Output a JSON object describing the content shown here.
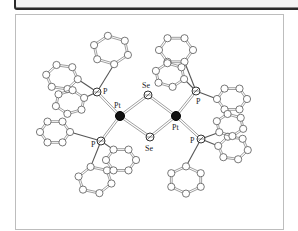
{
  "figure": {
    "type": "crystal-structure",
    "labels": {
      "pt": "Pt",
      "p": "P",
      "se": "Se"
    },
    "core_atoms": [
      {
        "id": "Pt1",
        "element": "Pt",
        "x": 120,
        "y": 116,
        "label": "Pt",
        "lx": 114,
        "ly": 108
      },
      {
        "id": "Pt2",
        "element": "Pt",
        "x": 176,
        "y": 116,
        "label": "Pt",
        "lx": 172,
        "ly": 130
      },
      {
        "id": "Se1",
        "element": "Se",
        "x": 148,
        "y": 95,
        "label": "Se",
        "lx": 142,
        "ly": 88
      },
      {
        "id": "Se2",
        "element": "Se",
        "x": 150,
        "y": 137,
        "label": "Se",
        "lx": 145,
        "ly": 151
      },
      {
        "id": "P1",
        "element": "P",
        "x": 97,
        "y": 92,
        "label": "P",
        "lx": 103,
        "ly": 94
      },
      {
        "id": "P2",
        "element": "P",
        "x": 101,
        "y": 141,
        "label": "P",
        "lx": 91,
        "ly": 147
      },
      {
        "id": "P3",
        "element": "P",
        "x": 196,
        "y": 91,
        "label": "P",
        "lx": 196,
        "ly": 104
      },
      {
        "id": "P4",
        "element": "P",
        "x": 201,
        "y": 139,
        "label": "P",
        "lx": 190,
        "ly": 143
      }
    ],
    "core_bonds": [
      [
        "Pt1",
        "Se1"
      ],
      [
        "Pt1",
        "Se2"
      ],
      [
        "Pt2",
        "Se1"
      ],
      [
        "Pt2",
        "Se2"
      ],
      [
        "Pt1",
        "P1"
      ],
      [
        "Pt1",
        "P2"
      ],
      [
        "Pt2",
        "P3"
      ],
      [
        "Pt2",
        "P4"
      ]
    ],
    "rings": [
      {
        "attach": "P1",
        "cx": 111,
        "cy": 50,
        "r": 18,
        "rot": 80
      },
      {
        "attach": "P1",
        "cx": 62,
        "cy": 77,
        "r": 16,
        "rot": 10
      },
      {
        "attach": "P1",
        "cx": 70,
        "cy": 102,
        "r": 15,
        "rot": 40
      },
      {
        "attach": "P2",
        "cx": 55,
        "cy": 132,
        "r": 15,
        "rot": 0
      },
      {
        "attach": "P2",
        "cx": 95,
        "cy": 180,
        "r": 17,
        "rot": 75
      },
      {
        "attach": "P2",
        "cx": 121,
        "cy": 160,
        "r": 15,
        "rot": 60
      },
      {
        "attach": "P3",
        "cx": 176,
        "cy": 50,
        "r": 17,
        "rot": 60
      },
      {
        "attach": "P3",
        "cx": 170,
        "cy": 75,
        "r": 15,
        "rot": 20
      },
      {
        "attach": "P3",
        "cx": 232,
        "cy": 99,
        "r": 15,
        "rot": 0
      },
      {
        "attach": "P4",
        "cx": 186,
        "cy": 180,
        "r": 17,
        "rot": 90
      },
      {
        "attach": "P4",
        "cx": 233,
        "cy": 148,
        "r": 15,
        "rot": 10
      },
      {
        "attach": "P4",
        "cx": 230,
        "cy": 125,
        "r": 14,
        "rot": 80
      }
    ]
  }
}
